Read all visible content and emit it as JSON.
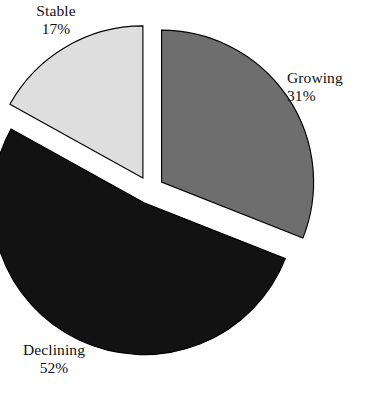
{
  "chart": {
    "background_color": "#ffffff",
    "outline_color": "#000000",
    "width": 367,
    "height": 393
  },
  "chart_data": {
    "type": "pie",
    "title": "",
    "subtitle": "",
    "xlabel": "",
    "ylabel": "",
    "exploded": true,
    "legend_position": "none",
    "grid": false,
    "labels_show_percent": true,
    "categories": [
      "Stable",
      "Growing",
      "Declining"
    ],
    "values": [
      17,
      31,
      52
    ],
    "units": "%",
    "slices": [
      {
        "label": "Stable",
        "percent_text": "17%",
        "value": 17,
        "color": "#dedede",
        "stroke": "#000000",
        "start_angle_deg": 299,
        "end_angle_deg": 360,
        "explode_direction_deg": 329.5,
        "label_position": "top-left"
      },
      {
        "label": "Growing",
        "percent_text": "31%",
        "value": 31,
        "color": "#6e6e6e",
        "stroke": "#000000",
        "start_angle_deg": 0,
        "end_angle_deg": 111.6,
        "explode_direction_deg": 55.8,
        "label_position": "right"
      },
      {
        "label": "Declining",
        "percent_text": "52%",
        "value": 52,
        "color": "#121212",
        "stroke": "#000000",
        "start_angle_deg": 111.6,
        "end_angle_deg": 299,
        "explode_direction_deg": 205.3,
        "label_position": "bottom-left"
      }
    ]
  }
}
